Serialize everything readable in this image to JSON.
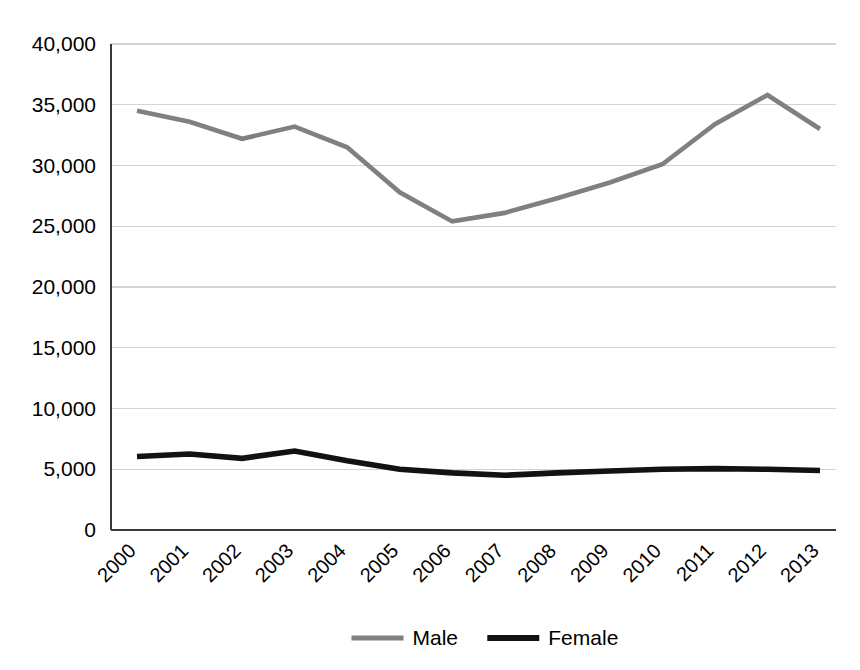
{
  "chart_data": {
    "type": "line",
    "title": "",
    "subtitle": "",
    "xlabel": "",
    "ylabel": "",
    "categories": [
      "2000",
      "2001",
      "2002",
      "2003",
      "2004",
      "2005",
      "2006",
      "2007",
      "2008",
      "2009",
      "2010",
      "2011",
      "2012",
      "2013"
    ],
    "series": [
      {
        "name": "Male",
        "color": "#808080",
        "values": [
          34500,
          33600,
          32200,
          33200,
          31500,
          27800,
          25400,
          26100,
          27300,
          28600,
          30100,
          33400,
          35800,
          33000
        ]
      },
      {
        "name": "Female",
        "color": "#121212",
        "values": [
          6050,
          6250,
          5900,
          6500,
          5700,
          5000,
          4700,
          4500,
          4700,
          4850,
          5000,
          5050,
          5000,
          4900
        ]
      }
    ],
    "ylim": [
      0,
      40000
    ],
    "ytick_values": [
      0,
      5000,
      10000,
      15000,
      20000,
      25000,
      30000,
      35000,
      40000
    ],
    "ytick_labels": [
      "0",
      "5,000",
      "10,000",
      "15,000",
      "20,000",
      "25,000",
      "30,000",
      "35,000",
      "40,000"
    ],
    "grid": true,
    "grid_axis": "y",
    "legend_position": "bottom",
    "xtick_rotation": -45
  },
  "legend": {
    "entries": [
      {
        "label": "Male",
        "color": "#808080",
        "line_width": 5
      },
      {
        "label": "Female",
        "color": "#121212",
        "line_width": 6
      }
    ]
  },
  "axes": {
    "y_axis_color": "#3a3a3a",
    "x_axis_color": "#3a3a3a",
    "grid_color": "#d4d4d4",
    "background": "#ffffff"
  }
}
